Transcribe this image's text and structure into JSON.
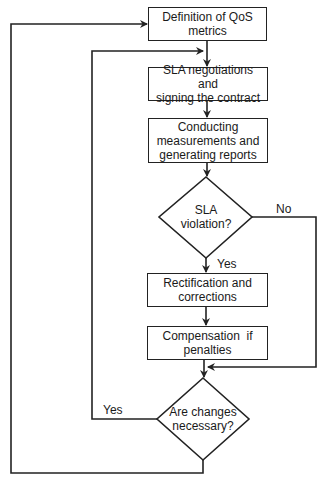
{
  "diagram": {
    "type": "flowchart",
    "nodes": [
      {
        "id": "n1",
        "kind": "process",
        "label": "Definition of QoS metrics"
      },
      {
        "id": "n2",
        "kind": "process",
        "label": "SLA negotiations and signing the contract"
      },
      {
        "id": "n3",
        "kind": "process",
        "label": "Conducting measurements and generating reports"
      },
      {
        "id": "d1",
        "kind": "decision",
        "label": "SLA violation?"
      },
      {
        "id": "n4",
        "kind": "process",
        "label": "Rectification and corrections"
      },
      {
        "id": "n5",
        "kind": "process",
        "label": "Compensation  if penalties"
      },
      {
        "id": "d2",
        "kind": "decision",
        "label": "Are changes necessary?"
      }
    ],
    "edges": [
      {
        "from": "n1",
        "to": "n2",
        "label": ""
      },
      {
        "from": "n2",
        "to": "n3",
        "label": ""
      },
      {
        "from": "n3",
        "to": "d1",
        "label": ""
      },
      {
        "from": "d1",
        "to": "n4",
        "label": "Yes"
      },
      {
        "from": "d1",
        "to": "d2",
        "label": "No"
      },
      {
        "from": "n4",
        "to": "n5",
        "label": ""
      },
      {
        "from": "n5",
        "to": "d2",
        "label": ""
      },
      {
        "from": "d2",
        "to": "n2",
        "label": "Yes"
      },
      {
        "from": "d2",
        "to": "n1",
        "label": ""
      }
    ],
    "labels": {
      "n1_line1": "Definition of QoS",
      "n1_line2": "metrics",
      "n2_line1": "SLA negotiations and",
      "n2_line2": "signing the contract",
      "n3_line1": "Conducting",
      "n3_line2": "measurements and",
      "n3_line3": "generating reports",
      "d1_line1": "SLA",
      "d1_line2": "violation?",
      "d1_yes": "Yes",
      "d1_no": "No",
      "n4_line1": "Rectification and",
      "n4_line2": "corrections",
      "n5_line1": "Compensation  if",
      "n5_line2": "penalties",
      "d2_line1": "Are changes",
      "d2_line2": "necessary?",
      "d2_yes": "Yes"
    }
  }
}
